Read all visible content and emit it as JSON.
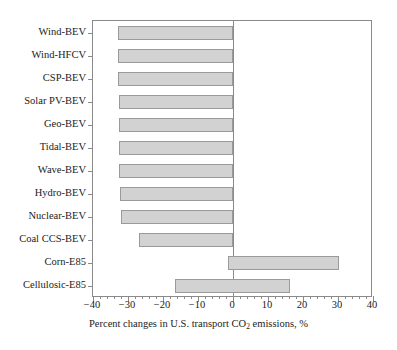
{
  "chart_data": {
    "type": "bar",
    "orientation": "horizontal",
    "title": "",
    "xlabel": "Percent changes in U.S. transport CO2 emissions, %",
    "xlabel_prefix": "Percent changes in U.S. transport CO",
    "xlabel_subscript": "2",
    "xlabel_suffix": " emissions, %",
    "ylabel": "",
    "categories": [
      "Wind-BEV",
      "Wind-HFCV",
      "CSP-BEV",
      "Solar PV-BEV",
      "Geo-BEV",
      "Tidal-BEV",
      "Wave-BEV",
      "Hydro-BEV",
      "Nuclear-BEV",
      "Coal CCS-BEV",
      "Corn-E85",
      "Cellulosic-E85"
    ],
    "bars": [
      {
        "label": "Wind-BEV",
        "start": -33.0,
        "end": 0.0
      },
      {
        "label": "Wind-HFCV",
        "start": -32.8,
        "end": 0.0
      },
      {
        "label": "CSP-BEV",
        "start": -33.0,
        "end": 0.0
      },
      {
        "label": "Solar PV-BEV",
        "start": -32.7,
        "end": 0.0
      },
      {
        "label": "Geo-BEV",
        "start": -32.7,
        "end": 0.0
      },
      {
        "label": "Tidal-BEV",
        "start": -32.6,
        "end": 0.0
      },
      {
        "label": "Wave-BEV",
        "start": -32.5,
        "end": 0.0
      },
      {
        "label": "Hydro-BEV",
        "start": -32.3,
        "end": 0.0
      },
      {
        "label": "Nuclear-BEV",
        "start": -32.1,
        "end": 0.0
      },
      {
        "label": "Coal CCS-BEV",
        "start": -26.9,
        "end": 0.0
      },
      {
        "label": "Corn-E85",
        "start": -1.5,
        "end": 30.3
      },
      {
        "label": "Cellulosic-E85",
        "start": -16.5,
        "end": 16.4
      }
    ],
    "values": [
      -33.0,
      -32.8,
      -33.0,
      -32.7,
      -32.7,
      -32.6,
      -32.5,
      -32.3,
      -32.1,
      -26.9,
      30.3,
      16.4
    ],
    "xlim": [
      -40,
      40
    ],
    "xticks": [
      -40,
      -30,
      -20,
      -10,
      0,
      10,
      20,
      30,
      40
    ],
    "xtick_labels": [
      "−40",
      "−30",
      "−20",
      "−10",
      "0",
      "10",
      "20",
      "30",
      "40"
    ],
    "x_minor_tick_step": 2,
    "grid": false,
    "legend": null,
    "colors": {
      "bar_fill": "#d2d2d2",
      "bar_edge": "#9a9a9a",
      "axis": "#8a8a8a",
      "text": "#222222",
      "background": "#ffffff"
    }
  }
}
